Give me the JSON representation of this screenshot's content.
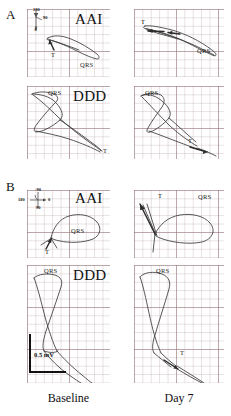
{
  "figure": {
    "sections": [
      {
        "id": "A",
        "letter": "A"
      },
      {
        "id": "B",
        "letter": "B"
      }
    ],
    "columns": [
      {
        "id": "baseline",
        "caption": "Baseline"
      },
      {
        "id": "day7",
        "caption": "Day 7"
      }
    ],
    "rows": [
      {
        "id": "aai",
        "mode": "AAI"
      },
      {
        "id": "ddd",
        "mode": "DDD"
      }
    ],
    "scalebar": {
      "label": "0.5 mV"
    },
    "compass_a": {
      "top": "180",
      "right": "90",
      "bottom": "0"
    },
    "compass_b": {
      "top": "-90",
      "left": "180",
      "right": "0",
      "bottom": "90"
    },
    "panels": [
      {
        "id": "a-aai-baseline",
        "section": "A",
        "mode": "AAI",
        "column": "Baseline",
        "mode_label": "AAI",
        "annotations": [
          {
            "name": "qrs-label",
            "text": "QRS"
          },
          {
            "name": "t-label",
            "text": "T"
          }
        ]
      },
      {
        "id": "a-aai-day7",
        "section": "A",
        "mode": "AAI",
        "column": "Day 7",
        "mode_label": "",
        "annotations": [
          {
            "name": "qrs-label",
            "text": "QRS"
          },
          {
            "name": "t-label",
            "text": "T"
          }
        ]
      },
      {
        "id": "a-ddd-baseline",
        "section": "A",
        "mode": "DDD",
        "column": "Baseline",
        "mode_label": "DDD",
        "annotations": [
          {
            "name": "qrs-label",
            "text": "QRS"
          },
          {
            "name": "t-label",
            "text": "T"
          }
        ]
      },
      {
        "id": "a-ddd-day7",
        "section": "A",
        "mode": "DDD",
        "column": "Day 7",
        "mode_label": "",
        "annotations": [
          {
            "name": "qrs-label",
            "text": "QRS"
          },
          {
            "name": "t-label",
            "text": "T"
          }
        ]
      },
      {
        "id": "b-aai-baseline",
        "section": "B",
        "mode": "AAI",
        "column": "Baseline",
        "mode_label": "AAI",
        "annotations": [
          {
            "name": "qrs-label",
            "text": "QRS"
          },
          {
            "name": "t-label",
            "text": "T"
          }
        ]
      },
      {
        "id": "b-aai-day7",
        "section": "B",
        "mode": "AAI",
        "column": "Day 7",
        "mode_label": "",
        "annotations": [
          {
            "name": "qrs-label",
            "text": "QRS"
          },
          {
            "name": "t-label",
            "text": "T"
          }
        ]
      },
      {
        "id": "b-ddd-baseline",
        "section": "B",
        "mode": "DDD",
        "column": "Baseline",
        "mode_label": "DDD",
        "annotations": [
          {
            "name": "qrs-label",
            "text": "QRS"
          }
        ]
      },
      {
        "id": "b-ddd-day7",
        "section": "B",
        "mode": "DDD",
        "column": "Day 7",
        "mode_label": "",
        "annotations": [
          {
            "name": "qrs-label",
            "text": "QRS"
          },
          {
            "name": "t-label",
            "text": "T"
          }
        ]
      }
    ]
  },
  "colors": {
    "trace": "#3a3a3a",
    "grid_major": "#9a7880",
    "grid_minor": "#af969b",
    "text": "#111111"
  }
}
